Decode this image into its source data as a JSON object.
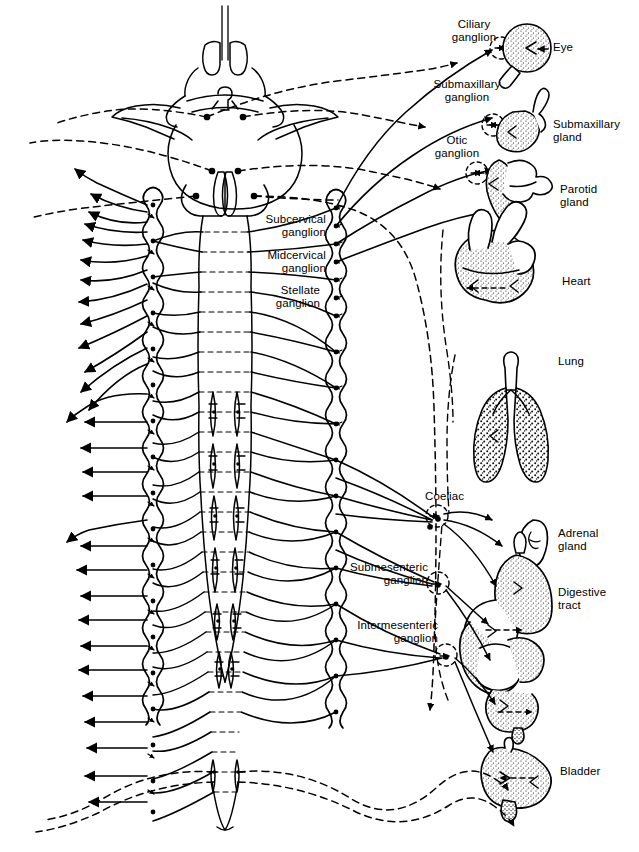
{
  "figure": {
    "background_color": "#ffffff",
    "ink_color": "#000000",
    "width": 639,
    "height": 852
  },
  "labels": {
    "ciliary_ganglion": "Ciliary\nganglion",
    "eye": "Eye",
    "submaxillary_ganglion": "Submaxillary\nganglion",
    "submaxillary_gland": "Submaxillary\ngland",
    "otic_ganglion": "Otic\nganglion",
    "parotid_gland": "Parotid\ngland",
    "subcervical_ganglion": "Subcervical\nganglion",
    "midcervical_ganglion": "Midcervical\nganglion",
    "stellate_ganglion": "Stellate\nganglion",
    "heart": "Heart",
    "lung": "Lung",
    "coeliac": "Coeliac",
    "adrenal_gland": "Adrenal\ngland",
    "submesenteric_ganglion": "Submesenteric\nganglion",
    "digestive_tract": "Digestive\ntract",
    "intermesenteric_ganglion": "Intermesenteric\nganglion",
    "bladder": "Bladder"
  },
  "structures": {
    "brain": "brain-dorsal-view",
    "spinal_cord": "spinal-cord",
    "left_sympathetic_chain": "left-sympathetic-chain",
    "right_sympathetic_chain": "right-sympathetic-chain",
    "gray_matter_nuclei": "spinal-gray-matter-nuclei",
    "somatic_efferent_arrows": "left-side-efferent-arrows",
    "parasympathetic_fibers": "dashed-parasympathetic-fibers",
    "sympathetic_fibers": "solid-sympathetic-fibers"
  },
  "legend_semantics": {
    "solid_line": "sympathetic (solid)",
    "dashed_line": "parasympathetic (dashed)"
  }
}
